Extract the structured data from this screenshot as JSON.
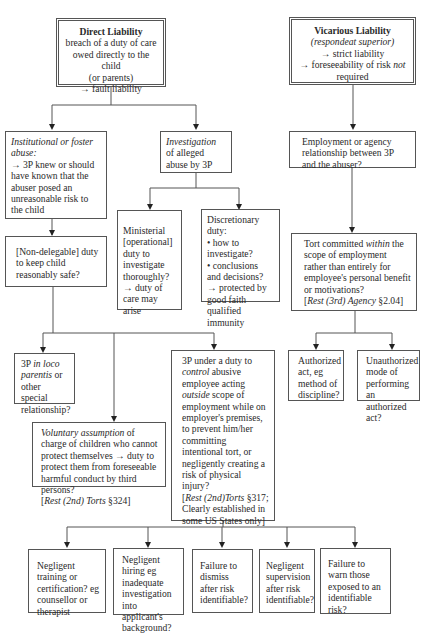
{
  "diagram": {
    "type": "flowchart",
    "topic": "Liability of third parties (3P) for child abuse",
    "nodes": {
      "direct": {
        "title": "Direct Liability",
        "lines": [
          "breach of a duty of care",
          "owed directly to the child",
          "(or parents)",
          "→  fault liability"
        ]
      },
      "vicarious": {
        "title": "Vicarious Liability",
        "subtitle": "(respondeat superior)",
        "line1": "→  strict liability",
        "line2_pre": "→  foreseeability of risk ",
        "line2_it": "not",
        "line3": "required"
      },
      "institutional": {
        "it": "Institutional or foster abuse:",
        "text": "→  3P knew or should have known that the abuser posed an unreasonable risk to the child"
      },
      "investigation": {
        "it": "Investigation",
        "text": " of alleged abuse by 3P"
      },
      "employment": {
        "text": "Employment or agency relationship between 3P and the abuser?"
      },
      "ministerial": {
        "text": "Ministerial [operational] duty to investigate thoroughly?",
        "arrow": "→  duty of care may arise"
      },
      "discretionary": {
        "title": "Discretionary duty:",
        "b1": "•  how to investigate?",
        "b2": "•  conclusions and decisions?",
        "arrow": "→  protected by good faith qualified immunity"
      },
      "tort_within": {
        "pre": "Tort committed ",
        "it": "within",
        "post": " the scope of employment rather than entirely for employee's personal benefit or motivations?",
        "cite_it": "Rest (3rd) Agency",
        "cite": " §2.04]",
        "cite_open": "["
      },
      "non_delegable": {
        "text": "[Non-delegable] duty to keep child reasonably safe?"
      },
      "loco_parentis": {
        "pre": "3P ",
        "it": "in loco parentis",
        "post": " or other special relationship?"
      },
      "voluntary": {
        "it": "Voluntary assumption",
        "text": " of charge of children who cannot protect themselves →  duty to protect them from foreseeable harmful conduct by third persons?",
        "cite_open": "[",
        "cite_it": "Rest (2nd) Torts",
        "cite": " §324]"
      },
      "control": {
        "pre": "3P under a duty to ",
        "it1": "control",
        "mid": " abusive employee acting ",
        "it2": "outside",
        "post": " scope of employment while on employer's premises, to prevent him/her committing intentional tort, or negligently creating a risk of physical injury?",
        "cite_open": "[",
        "cite_it": "Rest (2nd)Torts",
        "cite": " §317; Clearly established in some US States only]"
      },
      "authorized": {
        "text": "Authorized act, eg method of discipline?"
      },
      "unauthorized": {
        "text": "Unauthorized mode of performing an authorized act?"
      },
      "training": {
        "text": "Negligent training or certification? eg counsellor or therapist"
      },
      "hiring": {
        "text": "Negligent hiring eg inadequate investigation into applicant's background?"
      },
      "dismiss": {
        "text": "Failure to dismiss after risk identifiable?"
      },
      "supervision": {
        "text": "Negligent supervision after risk identifiable?"
      },
      "warn": {
        "text": "Failure to warn those exposed to an identifiable risk?"
      }
    },
    "edges": [
      [
        "direct",
        "institutional"
      ],
      [
        "direct",
        "investigation"
      ],
      [
        "investigation",
        "ministerial"
      ],
      [
        "investigation",
        "discretionary"
      ],
      [
        "institutional",
        "non_delegable"
      ],
      [
        "non_delegable",
        "loco_parentis"
      ],
      [
        "non_delegable",
        "voluntary"
      ],
      [
        "non_delegable",
        "control"
      ],
      [
        "vicarious",
        "employment"
      ],
      [
        "employment",
        "tort_within"
      ],
      [
        "tort_within",
        "authorized"
      ],
      [
        "tort_within",
        "unauthorized"
      ],
      [
        "control",
        "training"
      ],
      [
        "control",
        "hiring"
      ],
      [
        "control",
        "dismiss"
      ],
      [
        "control",
        "supervision"
      ],
      [
        "control",
        "warn"
      ]
    ]
  }
}
